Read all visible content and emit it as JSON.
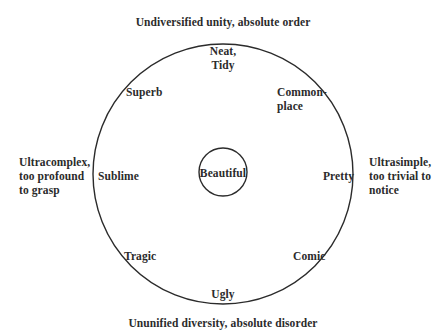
{
  "diagram": {
    "top_caption": "Undiversified unity, absolute order",
    "bottom_caption": "Ununified diversity, absolute disorder",
    "center_label": "Beautiful",
    "ring_labels": {
      "top": [
        "Neat,",
        "Tidy"
      ],
      "upper_left": "Superb",
      "upper_right": [
        "Common-",
        "place"
      ],
      "left": "Sublime",
      "right": "Pretty",
      "lower_left": "Tragic",
      "lower_right": "Comic",
      "bottom": "Ugly"
    },
    "left_extreme": [
      "Ultracomplex,",
      "too profound",
      "to grasp"
    ],
    "right_extreme": [
      "Ultrasimple,",
      "too trivial to",
      "notice"
    ],
    "shapes": {
      "outer_circle": {
        "cx": 223,
        "cy": 174,
        "r": 130,
        "stroke": "#2b2b2b"
      },
      "inner_circle": {
        "cx": 223,
        "cy": 172,
        "r": 24,
        "stroke": "#2b2b2b"
      }
    }
  }
}
